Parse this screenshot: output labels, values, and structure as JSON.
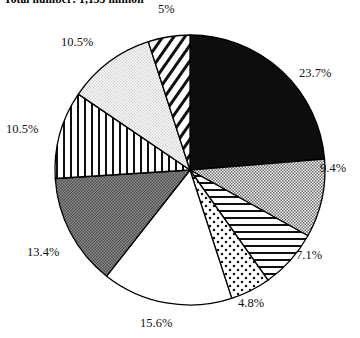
{
  "chart_data": {
    "type": "pie",
    "title": "Total number: 1,153 million",
    "subtitle": "",
    "xlabel": "",
    "ylabel": "",
    "legend_position": "none",
    "grid": false,
    "units": "percent",
    "total_labeled": 99.6,
    "start_angle_deg": 0,
    "direction": "clockwise",
    "categories": [
      "Slice 1",
      "Slice 2",
      "Slice 3",
      "Slice 4",
      "Slice 5",
      "Slice 6",
      "Slice 7",
      "Slice 8",
      "Slice 9"
    ],
    "values": [
      23.7,
      9.4,
      7.1,
      4.8,
      15.6,
      13.4,
      10.5,
      10.5,
      5.0
    ],
    "data_labels": [
      "23.7%",
      "9.4%",
      "7.1%",
      "4.8%",
      "15.6%",
      "13.4%",
      "10.5%",
      "10.5%",
      "5%"
    ],
    "slice_fills": [
      "solid-black",
      "checker-gray",
      "horizontal-lines",
      "dotted",
      "white",
      "dark-stipple",
      "vertical-lines",
      "light-gray",
      "diagonal-hatch"
    ],
    "slice_colors": [
      "#0d0d0d",
      "#9a9a9a",
      "#ffffff",
      "#ffffff",
      "#ffffff",
      "#666666",
      "#ffffff",
      "#e2e2e2",
      "#ffffff"
    ],
    "outline_color": "#000000",
    "center": {
      "x": 190,
      "y": 170
    },
    "radius": 135
  },
  "labels": {
    "p1": "23.7%",
    "p2": "9.4%",
    "p3": "7.1%",
    "p4": "4.8%",
    "p5": "15.6%",
    "p6": "13.4%",
    "p7": "10.5%",
    "p8": "10.5%",
    "p9": "5%"
  }
}
